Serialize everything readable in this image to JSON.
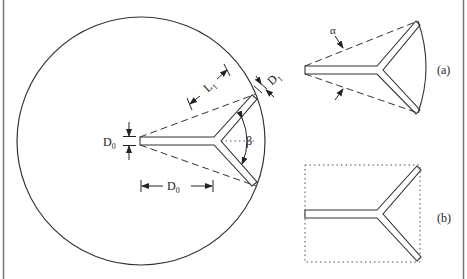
{
  "figure": {
    "panels": {
      "a": {
        "label": "(a)",
        "angle_label": "α"
      },
      "b": {
        "label": "(b)"
      }
    },
    "main": {
      "stem_width_label": "D",
      "stem_width_sub": "0",
      "stem_length_label": "D",
      "stem_length_sub": "0",
      "branch_length_label": "L",
      "branch_length_sub": "1",
      "branch_width_label": "D",
      "branch_width_sub": "1",
      "branch_angle_label": "β"
    },
    "colors": {
      "line": "#333333",
      "border": "#777777",
      "background": "#ffffff"
    }
  }
}
